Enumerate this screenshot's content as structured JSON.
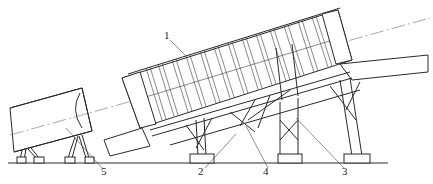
{
  "figure": {
    "type": "engineering line drawing",
    "colors": {
      "line": "#2a2a2a",
      "background": "#ffffff"
    },
    "labels": [
      {
        "id": "1",
        "text": "1",
        "x": 164,
        "y": 30
      },
      {
        "id": "2",
        "text": "2",
        "x": 198,
        "y": 166
      },
      {
        "id": "4",
        "text": "4",
        "x": 263,
        "y": 166
      },
      {
        "id": "3",
        "text": "3",
        "x": 342,
        "y": 166
      },
      {
        "id": "5",
        "text": "5",
        "x": 101,
        "y": 166
      }
    ]
  }
}
